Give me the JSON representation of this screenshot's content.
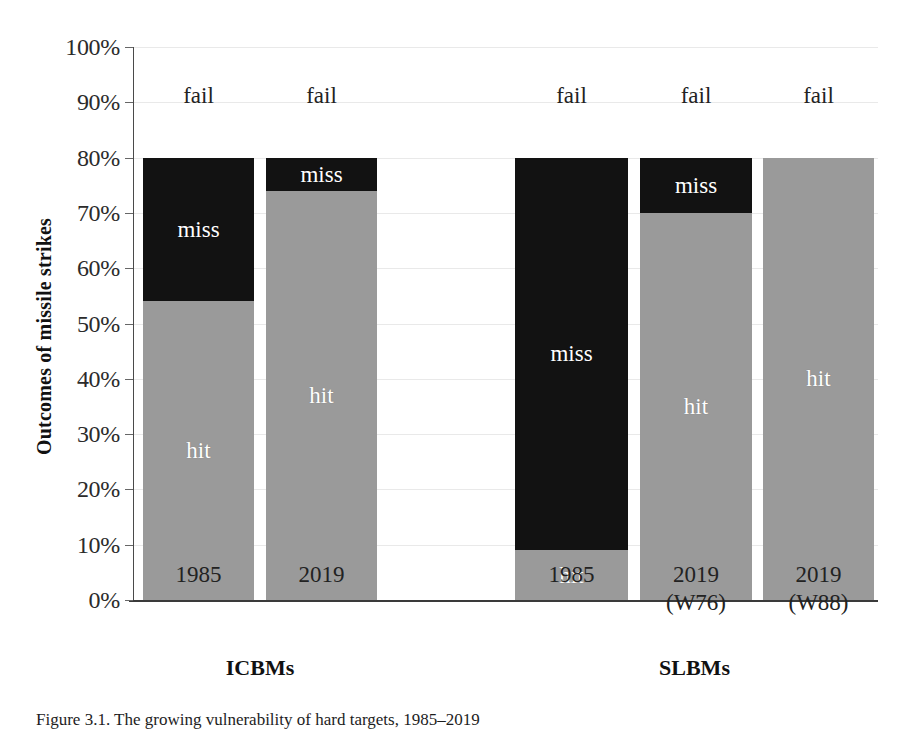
{
  "chart_data": {
    "type": "bar",
    "subtype": "stacked-percent",
    "title": "",
    "caption": "Figure 3.1. The growing vulnerability of hard targets, 1985–2019",
    "xlabel": "",
    "ylabel": "Outcomes of missile strikes",
    "ylim": [
      0,
      100
    ],
    "ytick_labels": [
      "0%",
      "10%",
      "20%",
      "30%",
      "40%",
      "50%",
      "60%",
      "70%",
      "80%",
      "90%",
      "100%"
    ],
    "ytick_values": [
      0,
      10,
      20,
      30,
      40,
      50,
      60,
      70,
      80,
      90,
      100
    ],
    "grid": true,
    "legend": "none",
    "segment_names": [
      "hit",
      "miss",
      "fail"
    ],
    "segment_colors": {
      "hit": "#9a9a9a",
      "miss": "#121212",
      "fail": "#ffffff"
    },
    "categories": [
      {
        "label": "1985",
        "sub": "",
        "group": "ICBMs"
      },
      {
        "label": "2019",
        "sub": "",
        "group": "ICBMs"
      },
      {
        "label": "1985",
        "sub": "",
        "group": "SLBMs"
      },
      {
        "label": "2019",
        "sub": "(W76)",
        "group": "SLBMs"
      },
      {
        "label": "2019",
        "sub": "(W88)",
        "group": "SLBMs"
      }
    ],
    "series": [
      {
        "name": "hit",
        "values": [
          54,
          74,
          9,
          70,
          80
        ]
      },
      {
        "name": "miss",
        "values": [
          26,
          6,
          71,
          10,
          0
        ]
      },
      {
        "name": "fail",
        "values": [
          20,
          20,
          20,
          20,
          20
        ]
      }
    ],
    "groups": [
      {
        "label": "ICBMs",
        "bars": [
          0,
          1
        ]
      },
      {
        "label": "SLBMs",
        "bars": [
          2,
          3,
          4
        ]
      }
    ],
    "annotations": {
      "fail_label": "fail",
      "hit_label": "hit",
      "miss_label": "miss"
    }
  },
  "bars": [
    {
      "x": 143,
      "width": 111,
      "hit": 54,
      "miss": 26,
      "fail": 20,
      "hit_label": "hit",
      "miss_label": "miss",
      "fail_label": "fail",
      "show_hit_label": true,
      "show_miss_label": true,
      "tick": "1985",
      "tick_sub": ""
    },
    {
      "x": 266,
      "width": 111,
      "hit": 74,
      "miss": 6,
      "fail": 20,
      "hit_label": "hit",
      "miss_label": "miss",
      "fail_label": "fail",
      "show_hit_label": true,
      "show_miss_label": true,
      "tick": "2019",
      "tick_sub": ""
    },
    {
      "x": 515,
      "width": 113,
      "hit": 9,
      "miss": 71,
      "fail": 20,
      "hit_label": "hit",
      "miss_label": "miss",
      "fail_label": "fail",
      "show_hit_label": true,
      "show_miss_label": true,
      "tick": "1985",
      "tick_sub": ""
    },
    {
      "x": 640,
      "width": 112,
      "hit": 70,
      "miss": 10,
      "fail": 20,
      "hit_label": "hit",
      "miss_label": "miss",
      "fail_label": "fail",
      "show_hit_label": true,
      "show_miss_label": true,
      "tick": "2019",
      "tick_sub": "(W76)"
    },
    {
      "x": 763,
      "width": 111,
      "hit": 80,
      "miss": 0,
      "fail": 20,
      "hit_label": "hit",
      "miss_label": "",
      "fail_label": "fail",
      "show_hit_label": true,
      "show_miss_label": false,
      "tick": "2019",
      "tick_sub": "(W88)"
    }
  ],
  "group_labels": [
    {
      "text": "ICBMs",
      "x": 143,
      "width": 234
    },
    {
      "text": "SLBMs",
      "x": 515,
      "width": 359
    }
  ]
}
